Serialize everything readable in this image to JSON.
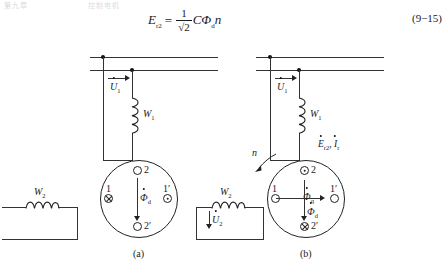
{
  "page": {
    "running_header_left": "第九章",
    "running_header_right": "控制电机",
    "equation": {
      "lhs": "E",
      "lhs_sub": "r2",
      "equals": "=",
      "numerator": "1",
      "denominator": "√2",
      "rhs": "CΦ",
      "rhs_sub": "d",
      "rhs_tail": "n",
      "number": "(9−15)"
    }
  },
  "figure": {
    "caption_a": "(a)",
    "caption_b": "(b)",
    "panel_a": {
      "excitation": {
        "voltage_label": "U",
        "voltage_sub": "1",
        "winding_label": "W",
        "winding_sub": "1"
      },
      "output": {
        "winding_label": "W",
        "winding_sub": "2"
      },
      "rotor": {
        "slot_top": "2",
        "slot_left": "1",
        "slot_right": "1′",
        "slot_bottom": "2′",
        "flux_label": "Φ",
        "flux_sub": "d"
      }
    },
    "panel_b": {
      "excitation": {
        "voltage_label": "U",
        "voltage_sub": "1",
        "winding_label": "W",
        "winding_sub": "1"
      },
      "emf_current_label": "E",
      "emf_current_sub": "r2",
      "emf_current_label2": ", I",
      "emf_current_sub2": "r",
      "output": {
        "winding_label": "W",
        "winding_sub": "2",
        "voltage_label": "U",
        "voltage_sub": "2"
      },
      "rotation_label": "n",
      "rotor": {
        "slot_top": "2",
        "slot_left": "1",
        "slot_right": "1′",
        "slot_bottom": "2′",
        "flux_q_label": "Φ",
        "flux_q_sub": "q",
        "flux_d_label": "Φ",
        "flux_d_sub": "d"
      }
    }
  },
  "colors": {
    "ink": "#1a1a1a",
    "line": "#333333",
    "paper": "#ffffff"
  }
}
